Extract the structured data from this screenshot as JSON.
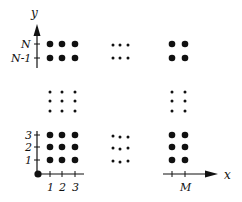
{
  "diagram": {
    "title": "",
    "axes": {
      "x_label": "x",
      "y_label": "y",
      "x_ticks": [
        "1",
        "2",
        "3",
        "M"
      ],
      "y_ticks": [
        "1",
        "2",
        "3",
        "N-1",
        "N"
      ]
    },
    "grid_description": "Lattice of points indexed 1..M in x and 1..N in y, with ellipsis dots indicating omitted columns and rows",
    "colors": {
      "ink": "#111111",
      "background": "#ffffff"
    }
  },
  "labels": {
    "y": "y",
    "x": "x",
    "N": "N",
    "N_minus_1": "N-1",
    "one_y": "1",
    "two_y": "2",
    "three_y": "3",
    "one_x": "1",
    "two_x": "2",
    "three_x": "3",
    "M": "M"
  }
}
